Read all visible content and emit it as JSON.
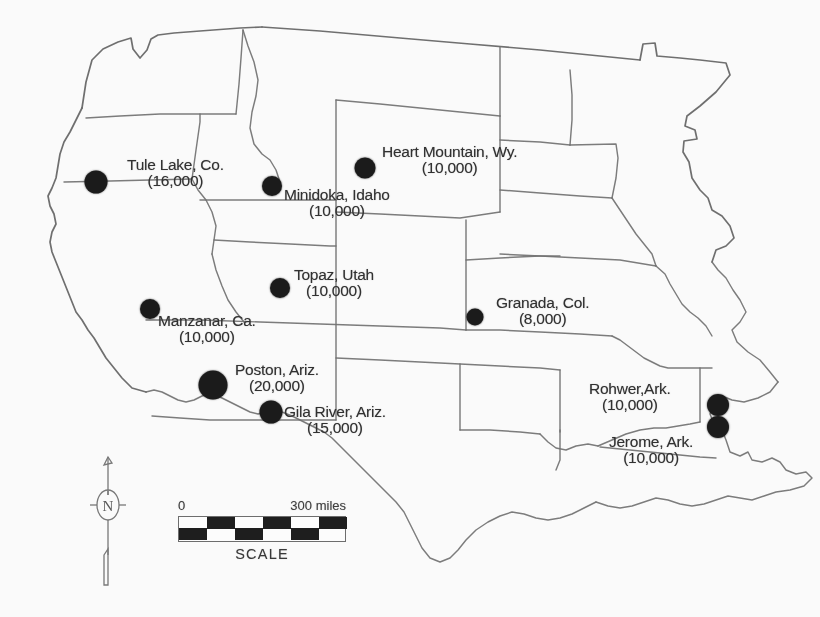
{
  "map": {
    "title": "Japanese American Internment Camps",
    "region": "Western and Central United States",
    "background_color": "#fdfdfd",
    "line_color": "#6e6e6e",
    "dot_color": "#141414"
  },
  "camps": [
    {
      "id": "tule-lake",
      "name": "Tule Lake, Co.",
      "population": "(16,000)",
      "population_value": 16000,
      "dot": {
        "x": 96,
        "y": 182,
        "size": 23
      },
      "label": {
        "x": 127,
        "y": 157,
        "align": "center"
      }
    },
    {
      "id": "minidoka",
      "name": "Minidoka, Idaho",
      "population": "(10,000)",
      "population_value": 10000,
      "dot": {
        "x": 272,
        "y": 186,
        "size": 20
      },
      "label": {
        "x": 284,
        "y": 187,
        "align": "center"
      }
    },
    {
      "id": "heart-mountain",
      "name": "Heart Mountain, Wy.",
      "population": "(10,000)",
      "population_value": 10000,
      "dot": {
        "x": 365,
        "y": 168,
        "size": 21
      },
      "label": {
        "x": 382,
        "y": 144,
        "align": "center"
      }
    },
    {
      "id": "topaz",
      "name": "Topaz, Utah",
      "population": "(10,000)",
      "population_value": 10000,
      "dot": {
        "x": 280,
        "y": 288,
        "size": 20
      },
      "label": {
        "x": 294,
        "y": 267,
        "align": "center"
      }
    },
    {
      "id": "granada",
      "name": "Granada, Col.",
      "population": "(8,000)",
      "population_value": 8000,
      "dot": {
        "x": 475,
        "y": 317,
        "size": 17
      },
      "label": {
        "x": 496,
        "y": 295,
        "align": "center"
      }
    },
    {
      "id": "manzanar",
      "name": "Manzanar, Ca.",
      "population": "(10,000)",
      "population_value": 10000,
      "dot": {
        "x": 150,
        "y": 309,
        "size": 20
      },
      "label": {
        "x": 158,
        "y": 313,
        "align": "center"
      }
    },
    {
      "id": "poston",
      "name": "Poston, Ariz.",
      "population": "(20,000)",
      "population_value": 20000,
      "dot": {
        "x": 213,
        "y": 385,
        "size": 29
      },
      "label": {
        "x": 235,
        "y": 362,
        "align": "center"
      }
    },
    {
      "id": "gila-river",
      "name": "Gila River, Ariz.",
      "population": "(15,000)",
      "population_value": 15000,
      "dot": {
        "x": 271,
        "y": 412,
        "size": 23
      },
      "label": {
        "x": 284,
        "y": 404,
        "align": "center"
      }
    },
    {
      "id": "rohwer",
      "name": "Rohwer,Ark.",
      "population": "(10,000)",
      "population_value": 10000,
      "dot": {
        "x": 718,
        "y": 405,
        "size": 22
      },
      "label": {
        "x": 589,
        "y": 381,
        "align": "center"
      }
    },
    {
      "id": "jerome",
      "name": "Jerome, Ark.",
      "population": "(10,000)",
      "population_value": 10000,
      "dot": {
        "x": 718,
        "y": 427,
        "size": 22
      },
      "label": {
        "x": 609,
        "y": 434,
        "align": "center"
      }
    }
  ],
  "compass": {
    "label": "N",
    "icon": "compass-needle-icon"
  },
  "scale": {
    "min_label": "0",
    "max_label": "300 miles",
    "caption": "SCALE",
    "segments": 6
  }
}
